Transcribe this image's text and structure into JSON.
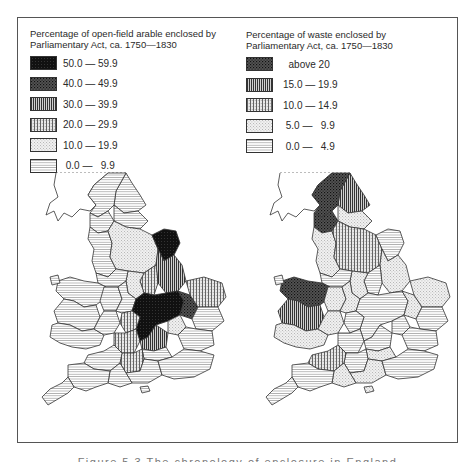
{
  "figure": {
    "caption": "Figure 5.3   The chronology of enclosure in England"
  },
  "left_legend": {
    "title_line1": "Percentage of open-field arable enclosed by",
    "title_line2": "Parliamentary Act, ca. 1750—1830",
    "items": [
      {
        "label": "50.0 — 59.9",
        "pattern": "solid-black"
      },
      {
        "label": "40.0 — 49.9",
        "pattern": "dense-crosshatch"
      },
      {
        "label": "30.0 — 39.9",
        "pattern": "dense-vertical"
      },
      {
        "label": "20.0 — 29.9",
        "pattern": "vertical-dotted"
      },
      {
        "label": "10.0 — 19.9",
        "pattern": "stipple"
      },
      {
        "label": " 0.0 —   9.9",
        "pattern": "horizontal-lines"
      }
    ]
  },
  "right_legend": {
    "title_line1": "Percentage of waste enclosed by",
    "title_line2": "Parliamentary Act, ca. 1750—1830",
    "items": [
      {
        "label": "  above 20",
        "pattern": "dense-crosshatch"
      },
      {
        "label": "15.0 — 19.9",
        "pattern": "dense-vertical"
      },
      {
        "label": "10.0 — 14.9",
        "pattern": "vertical-dotted"
      },
      {
        "label": " 5.0 —   9.9",
        "pattern": "stipple"
      },
      {
        "label": " 0.0 —   4.9",
        "pattern": "horizontal-lines"
      }
    ]
  },
  "maps": {
    "left": {
      "subject": "open-field arable enclosed, England and Wales counties"
    },
    "right": {
      "subject": "waste enclosed, England and Wales counties"
    }
  },
  "colors": {
    "ink": "#222222",
    "frame": "#555555",
    "paper": "#ffffff"
  }
}
